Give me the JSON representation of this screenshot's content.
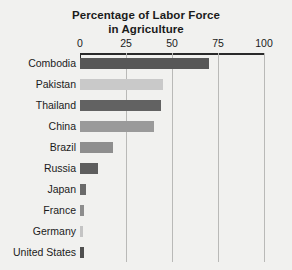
{
  "chart_data": {
    "type": "bar",
    "orientation": "horizontal",
    "title": "Percentage of Labor Force in Agriculture",
    "title_line1": "Percentage of Labor Force",
    "title_line2": "in Agriculture",
    "xlabel": "",
    "ylabel": "",
    "xlim": [
      0,
      100
    ],
    "xticks": [
      0,
      25,
      50,
      75,
      100
    ],
    "xtick_labels": [
      "0",
      "25",
      "50",
      "75",
      "100"
    ],
    "grid": true,
    "grid_axis": "x",
    "axis_position": "top",
    "legend": false,
    "categories": [
      "Combodia",
      "Pakistan",
      "Thailand",
      "China",
      "Brazil",
      "Russia",
      "Japan",
      "France",
      "Germany",
      "United States"
    ],
    "values": [
      70,
      45,
      44,
      40,
      18,
      10,
      3,
      2,
      1.5,
      2
    ],
    "bar_colors": [
      "#575757",
      "#c9c9c9",
      "#626262",
      "#9a9a9a",
      "#8e8e8e",
      "#5e5e5e",
      "#6a6a6a",
      "#8d8d8d",
      "#c4c4c4",
      "#4f4f4f"
    ],
    "bars": [
      {
        "label": "Combodia",
        "value": 70,
        "color": "#575757"
      },
      {
        "label": "Pakistan",
        "value": 45,
        "color": "#c9c9c9"
      },
      {
        "label": "Thailand",
        "value": 44,
        "color": "#626262"
      },
      {
        "label": "China",
        "value": 40,
        "color": "#9a9a9a"
      },
      {
        "label": "Brazil",
        "value": 18,
        "color": "#8e8e8e"
      },
      {
        "label": "Russia",
        "value": 10,
        "color": "#5e5e5e"
      },
      {
        "label": "Japan",
        "value": 3,
        "color": "#6a6a6a"
      },
      {
        "label": "France",
        "value": 2,
        "color": "#8d8d8d"
      },
      {
        "label": "Germany",
        "value": 1.5,
        "color": "#c4c4c4"
      },
      {
        "label": "United States",
        "value": 2,
        "color": "#4f4f4f"
      }
    ],
    "colors": {
      "background": "#f1f1ef",
      "axis": "#2a2a2a",
      "gridline": "#b9b9b7",
      "text": "#1b1b1b"
    }
  }
}
